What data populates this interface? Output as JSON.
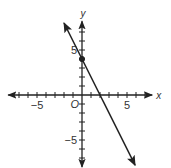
{
  "chart_data": {
    "type": "line",
    "title": "",
    "xlabel": "x",
    "ylabel": "y",
    "origin_label": "O",
    "xlim": [
      -8.2,
      7.8
    ],
    "ylim": [
      -8,
      8.2
    ],
    "x_tick_step": 1,
    "y_tick_step": 1,
    "x_tick_labels": [
      {
        "value": -5,
        "label": "−5"
      },
      {
        "value": 5,
        "label": "5"
      }
    ],
    "y_tick_labels": [
      {
        "value": 5,
        "label": "5"
      },
      {
        "value": -5,
        "label": "−5"
      }
    ],
    "grid": false,
    "legend": null,
    "series": [
      {
        "name": "y = -2x + 4",
        "equation": {
          "slope": -2,
          "intercept": 4
        },
        "x": [
          -2,
          5.9
        ],
        "y": [
          8,
          -7.8
        ],
        "arrows_both_ends": true,
        "color": "#222222"
      }
    ],
    "points": [
      {
        "x": 0,
        "y": 4,
        "label": "y-intercept",
        "filled": true
      }
    ],
    "x_intercept": 2
  },
  "colors": {
    "axis": "#222222",
    "line": "#222222",
    "text": "#333333",
    "background": "#ffffff"
  }
}
